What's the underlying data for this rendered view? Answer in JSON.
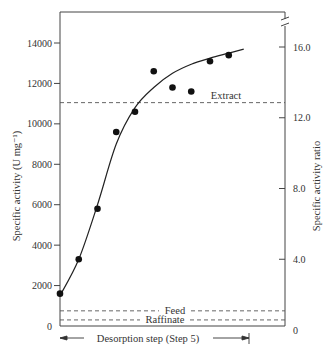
{
  "chart_data": {
    "type": "scatter",
    "title": "",
    "xlabel": "Desorption step (Step 5)",
    "ylabel": "Specific activity (U mg⁻¹)",
    "y2label": "Specific activity ratio",
    "ylim": [
      0,
      15500
    ],
    "y2lim": [
      0,
      17.5
    ],
    "yticks": [
      0,
      2000,
      4000,
      6000,
      8000,
      10000,
      12000,
      14000
    ],
    "ytick_labels": [
      "0",
      "2000",
      "4000",
      "6000",
      "8000",
      "10000",
      "12000",
      "14000"
    ],
    "y2ticks": [
      0,
      4.0,
      8.0,
      12.0,
      16.0
    ],
    "y2tick_labels": [
      "0",
      "4.0",
      "8.0",
      "12.0",
      "16.0"
    ],
    "grid": false,
    "legend": null,
    "axis_break": "right axis, top",
    "series": [
      {
        "name": "Measured specific activity",
        "kind": "points",
        "x": [
          1,
          2,
          3,
          4,
          5,
          6,
          7,
          8,
          9,
          10
        ],
        "values": [
          1600,
          3300,
          5800,
          9600,
          10600,
          12600,
          11800,
          11600,
          13100,
          13400
        ]
      },
      {
        "name": "Fitted curve",
        "kind": "line",
        "x": [
          1,
          2,
          3,
          4,
          5,
          6,
          7,
          8,
          9,
          10,
          10.8
        ],
        "values": [
          1500,
          3300,
          6000,
          9000,
          10800,
          11800,
          12500,
          12950,
          13250,
          13500,
          13700
        ]
      }
    ],
    "reference_lines": [
      {
        "label": "Extract",
        "value": 11050,
        "style": "dashed"
      },
      {
        "label": "Feed",
        "value": 750,
        "style": "dashed"
      },
      {
        "label": "Raffinate",
        "value": 300,
        "style": "dashed"
      }
    ],
    "annotations": [
      {
        "text": "Desorption step (Step 5)",
        "type": "span-arrow",
        "x_range": [
          1,
          10.3
        ]
      }
    ]
  }
}
